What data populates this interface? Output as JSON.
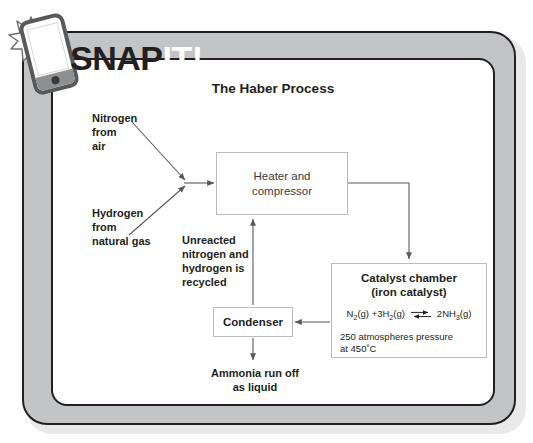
{
  "brand": {
    "text_dark": "SNAP",
    "text_light": "IT!",
    "phone_icon": "phone-icon",
    "starburst_icon": "starburst-icon"
  },
  "diagram": {
    "title": "The Haber Process",
    "type": "flow-diagram",
    "nodes": [
      {
        "id": "heater",
        "label": "Heater and\ncompressor",
        "line1": "Heater and",
        "line2": "compressor"
      },
      {
        "id": "catalyst",
        "heading_line1": "Catalyst chamber",
        "heading_line2": "(iron catalyst)",
        "equation_left": "N2(g) +3H2(g)",
        "equation_right": "2NH3(g)",
        "equation_symbol": "equilibrium-arrows",
        "conditions_line1": "250 atmospheres pressure",
        "conditions_line2": "at 450˚C"
      },
      {
        "id": "condenser",
        "label": "Condenser"
      }
    ],
    "labels": {
      "nitrogen": {
        "line1": "Nitrogen",
        "line2": "from",
        "line3": "air"
      },
      "hydrogen": {
        "line1": "Hydrogen",
        "line2": "from",
        "line3": "natural gas"
      },
      "recycled": {
        "line1": "Unreacted",
        "line2": "nitrogen and",
        "line3": "hydrogen is",
        "line4": "recycled"
      },
      "ammonia": {
        "line1": "Ammonia run off",
        "line2": "as liquid"
      }
    }
  },
  "colors": {
    "frame_gray": "#c3c4c6",
    "outline_dark": "#231f20",
    "panel_white": "#ffffff",
    "box_border": "#b9bcbe",
    "arrow": "#58595b"
  }
}
